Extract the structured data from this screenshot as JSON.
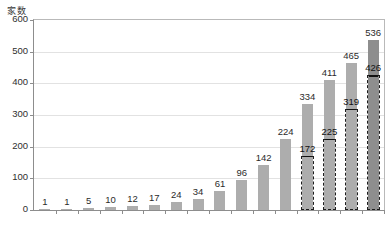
{
  "axis_title": "家数",
  "chart_data": {
    "type": "bar",
    "title": "",
    "subtitle": "",
    "xlabel": "",
    "ylabel": "家数",
    "ylim": [
      0,
      600
    ],
    "ytick_labels": [
      "600",
      "500",
      "400",
      "300",
      "200",
      "100",
      "0"
    ],
    "ytick_values": [
      600,
      500,
      400,
      300,
      200,
      100,
      0
    ],
    "grid": true,
    "legend_position": "none",
    "categories": [
      "",
      "",
      "",
      "",
      "",
      "",
      "",
      "",
      "",
      "",
      "",
      "",
      "",
      "",
      "",
      ""
    ],
    "series": [
      {
        "name": "総数",
        "style": "solid-fill",
        "color": "#adadad",
        "values": [
          1,
          1,
          5,
          10,
          12,
          17,
          24,
          34,
          61,
          96,
          142,
          224,
          334,
          411,
          465,
          536
        ]
      },
      {
        "name": "内数",
        "style": "dashed-outline",
        "color": "#111111",
        "values": [
          null,
          null,
          null,
          null,
          null,
          null,
          null,
          null,
          null,
          null,
          null,
          null,
          172,
          225,
          319,
          426
        ]
      }
    ],
    "data_labels_primary": [
      "1",
      "1",
      "5",
      "10",
      "12",
      "17",
      "24",
      "34",
      "61",
      "96",
      "142",
      "224",
      "334",
      "411",
      "465",
      "536"
    ],
    "data_labels_secondary": [
      "",
      "",
      "",
      "",
      "",
      "",
      "",
      "",
      "",
      "",
      "",
      "",
      "172",
      "225",
      "319",
      "426"
    ],
    "last_bar_color": "#8e8e8e",
    "annotations": []
  }
}
